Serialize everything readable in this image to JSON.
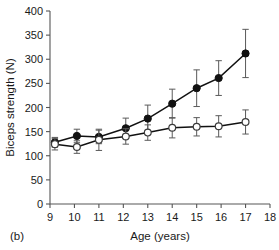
{
  "figure": {
    "panel_label": "(b)"
  },
  "chart_data": {
    "type": "line",
    "title": "",
    "xlabel": "Age (years)",
    "ylabel": "Biceps strength (N)",
    "xlim": [
      9,
      18
    ],
    "ylim": [
      0,
      400
    ],
    "xticks": [
      9,
      10,
      11,
      12,
      13,
      14,
      15,
      16,
      17,
      18
    ],
    "xtick_labels": [
      "9",
      "10",
      "11",
      "12",
      "13",
      "14",
      "15",
      "16",
      "17",
      "18"
    ],
    "yticks": [
      0,
      50,
      100,
      150,
      200,
      250,
      300,
      350,
      400
    ],
    "ytick_labels": [
      "0",
      "50",
      "100",
      "150",
      "200",
      "250",
      "300",
      "350",
      "400"
    ],
    "grid": false,
    "legend": "none",
    "error_bars": "symmetric-sd",
    "series": [
      {
        "name": "filled-circles",
        "marker": "filled-circle",
        "color": "#111111",
        "x": [
          9.2,
          10.1,
          11.0,
          12.1,
          13.0,
          14.0,
          15.0,
          15.9,
          17.0
        ],
        "values": [
          128,
          141,
          139,
          157,
          177,
          208,
          240,
          261,
          312
        ],
        "errors": [
          10,
          14,
          14,
          21,
          28,
          30,
          38,
          36,
          50
        ]
      },
      {
        "name": "open-circles",
        "marker": "open-circle",
        "color": "#3b3b3b",
        "x": [
          9.2,
          10.1,
          11.0,
          12.1,
          13.0,
          14.0,
          15.0,
          15.9,
          17.0
        ],
        "values": [
          124,
          118,
          133,
          140,
          148,
          158,
          160,
          161,
          170
        ],
        "errors": [
          12,
          13,
          22,
          16,
          16,
          21,
          19,
          22,
          25
        ]
      }
    ]
  }
}
